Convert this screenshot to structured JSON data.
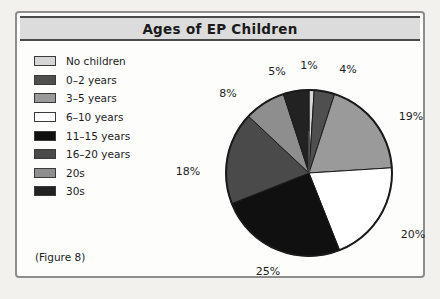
{
  "figure": {
    "title": "Ages of EP Children",
    "caption": "(Figure 8)"
  },
  "legend": {
    "items": [
      {
        "label": "No children",
        "color": "#d6d6d6"
      },
      {
        "label": "0–2 years",
        "color": "#4f4f4f"
      },
      {
        "label": "3–5 years",
        "color": "#9a9a9a"
      },
      {
        "label": "6–10 years",
        "color": "#ffffff"
      },
      {
        "label": "11–15 years",
        "color": "#101010"
      },
      {
        "label": "16–20 years",
        "color": "#4a4a4a"
      },
      {
        "label": "20s",
        "color": "#8e8e8e"
      },
      {
        "label": "30s",
        "color": "#222222"
      }
    ]
  },
  "labels": {
    "p1": "1%",
    "p4": "4%",
    "p19": "19%",
    "p20": "20%",
    "p25": "25%",
    "p18": "18%",
    "p8": "8%",
    "p5": "5%"
  },
  "chart_data": {
    "type": "pie",
    "title": "Ages of EP Children",
    "unit": "percent",
    "start_angle_deg": 0,
    "direction": "clockwise",
    "legend_position": "left",
    "categories": [
      "No children",
      "0–2 years",
      "3–5 years",
      "6–10 years",
      "11–15 years",
      "16–20 years",
      "20s",
      "30s"
    ],
    "values": [
      1,
      4,
      19,
      20,
      25,
      18,
      8,
      5
    ],
    "colors": [
      "#d6d6d6",
      "#4f4f4f",
      "#9a9a9a",
      "#ffffff",
      "#101010",
      "#4a4a4a",
      "#8e8e8e",
      "#222222"
    ],
    "labels": [
      "1%",
      "4%",
      "19%",
      "20%",
      "25%",
      "18%",
      "8%",
      "5%"
    ],
    "total": 100
  }
}
